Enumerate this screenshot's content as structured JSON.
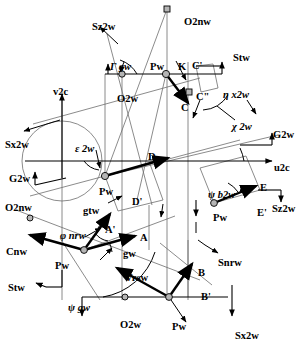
{
  "figure": {
    "type": "vector-diagram",
    "background_color": "#ffffff",
    "line_color": "#000000",
    "thin_line_color": "#555555",
    "node_fill": "#b0b0b0",
    "width": 302,
    "height": 347
  },
  "labels": [
    {
      "id": "sz2w-top",
      "text": "Sz2w",
      "x": 92,
      "y": 22,
      "italic": false
    },
    {
      "id": "o2nw-top",
      "text": "O2nw",
      "x": 184,
      "y": 17,
      "italic": false
    },
    {
      "id": "stw-top",
      "text": "Stw",
      "x": 233,
      "y": 53,
      "italic": false
    },
    {
      "id": "gamma-gw",
      "text": "Γ gw",
      "x": 110,
      "y": 62,
      "italic": true
    },
    {
      "id": "pw-top",
      "text": "Pw",
      "x": 150,
      "y": 62,
      "italic": false
    },
    {
      "id": "k-point",
      "text": "K",
      "x": 178,
      "y": 62,
      "italic": false
    },
    {
      "id": "cprime-top",
      "text": "C'",
      "x": 192,
      "y": 61,
      "italic": false
    },
    {
      "id": "v2c",
      "text": "v2c",
      "x": 53,
      "y": 87,
      "italic": false
    },
    {
      "id": "o2w-top",
      "text": "O2w",
      "x": 117,
      "y": 94,
      "italic": false
    },
    {
      "id": "c2prime",
      "text": "C\"",
      "x": 196,
      "y": 92,
      "italic": false
    },
    {
      "id": "c-point",
      "text": "C",
      "x": 181,
      "y": 103,
      "italic": false
    },
    {
      "id": "eta-x2w",
      "text": "η x2w",
      "x": 223,
      "y": 90,
      "italic": true
    },
    {
      "id": "chi-2w",
      "text": "χ 2w",
      "x": 232,
      "y": 122,
      "italic": true
    },
    {
      "id": "sx2w-left",
      "text": "Sx2w",
      "x": 5,
      "y": 140,
      "italic": false
    },
    {
      "id": "eps-2w",
      "text": "ε 2w",
      "x": 75,
      "y": 144,
      "italic": true
    },
    {
      "id": "g2w-right",
      "text": "G2w",
      "x": 273,
      "y": 130,
      "italic": false
    },
    {
      "id": "u2c",
      "text": "u2c",
      "x": 274,
      "y": 163,
      "italic": false
    },
    {
      "id": "d-point",
      "text": "D",
      "x": 148,
      "y": 152,
      "italic": false
    },
    {
      "id": "g2w-left",
      "text": "G2w",
      "x": 9,
      "y": 174,
      "italic": false
    },
    {
      "id": "pw-center",
      "text": "Pw",
      "x": 99,
      "y": 187,
      "italic": false
    },
    {
      "id": "dprime",
      "text": "D'",
      "x": 132,
      "y": 197,
      "italic": false
    },
    {
      "id": "psi-b2w",
      "text": "ψ b2w",
      "x": 208,
      "y": 190,
      "italic": true
    },
    {
      "id": "e-point",
      "text": "E",
      "x": 260,
      "y": 183,
      "italic": false
    },
    {
      "id": "o2nw-left",
      "text": "O2nw",
      "x": 5,
      "y": 203,
      "italic": false
    },
    {
      "id": "gtw",
      "text": "gtw",
      "x": 83,
      "y": 206,
      "italic": false
    },
    {
      "id": "eprime",
      "text": "E'",
      "x": 257,
      "y": 208,
      "italic": false
    },
    {
      "id": "sz2w-right",
      "text": "Sz2w",
      "x": 272,
      "y": 204,
      "italic": false
    },
    {
      "id": "pw-right",
      "text": "Pw",
      "x": 213,
      "y": 213,
      "italic": false
    },
    {
      "id": "phi-nrw",
      "text": "φ nrw",
      "x": 60,
      "y": 231,
      "italic": true
    },
    {
      "id": "aprime",
      "text": "A'",
      "x": 105,
      "y": 225,
      "italic": false
    },
    {
      "id": "a-point",
      "text": "A",
      "x": 140,
      "y": 233,
      "italic": false
    },
    {
      "id": "cnw",
      "text": "Cnw",
      "x": 6,
      "y": 247,
      "italic": false
    },
    {
      "id": "gw-label",
      "text": "gw",
      "x": 123,
      "y": 249,
      "italic": false
    },
    {
      "id": "snrw",
      "text": "Snrw",
      "x": 218,
      "y": 258,
      "italic": false
    },
    {
      "id": "pw-lower-l",
      "text": "Pw",
      "x": 55,
      "y": 261,
      "italic": false
    },
    {
      "id": "b-point",
      "text": "B",
      "x": 198,
      "y": 268,
      "italic": false
    },
    {
      "id": "vrsw",
      "text": "Vrsw",
      "x": 125,
      "y": 273,
      "italic": false
    },
    {
      "id": "stw-left",
      "text": "Stw",
      "x": 8,
      "y": 283,
      "italic": false
    },
    {
      "id": "bprime",
      "text": "B'",
      "x": 201,
      "y": 292,
      "italic": false
    },
    {
      "id": "psi-gw",
      "text": "ψ gw",
      "x": 68,
      "y": 303,
      "italic": true
    },
    {
      "id": "o2w-bottom",
      "text": "O2w",
      "x": 120,
      "y": 320,
      "italic": false
    },
    {
      "id": "pw-bottom",
      "text": "Pw",
      "x": 172,
      "y": 322,
      "italic": false
    },
    {
      "id": "sx2w-bottom",
      "text": "Sx2w",
      "x": 235,
      "y": 331,
      "italic": false
    }
  ],
  "nodes": [
    {
      "id": "node-o2nw-top",
      "x": 167,
      "y": 9,
      "shape": "square"
    },
    {
      "id": "node-o2w-top",
      "x": 122,
      "y": 74,
      "shape": "circle"
    },
    {
      "id": "node-pw-top",
      "x": 166,
      "y": 74,
      "shape": "circle"
    },
    {
      "id": "node-c2prime",
      "x": 189,
      "y": 92,
      "shape": "square"
    },
    {
      "id": "node-pw-center",
      "x": 105,
      "y": 176,
      "shape": "circle"
    },
    {
      "id": "node-pw-right",
      "x": 214,
      "y": 203,
      "shape": "circle"
    },
    {
      "id": "node-pw-lower",
      "x": 84,
      "y": 250,
      "shape": "circle"
    },
    {
      "id": "node-o2nw-left",
      "x": 30,
      "y": 218,
      "shape": "circle"
    },
    {
      "id": "node-o2w-bottom",
      "x": 125,
      "y": 297,
      "shape": "circle"
    },
    {
      "id": "node-pw-bottom",
      "x": 169,
      "y": 297,
      "shape": "circle"
    }
  ],
  "axes": {
    "horizontal_top": {
      "from_x": 105,
      "from_y": 74,
      "to_x": 222,
      "to_y": 74
    },
    "horizontal_mid": {
      "from_x": 25,
      "from_y": 161,
      "to_x": 278,
      "to_y": 161,
      "label": "u2c"
    },
    "vertical_left": {
      "from_x": 62,
      "from_y": 178,
      "to_x": 62,
      "to_y": 92,
      "label": "v2c"
    },
    "horizontal_bottom": {
      "from_x": 82,
      "from_y": 297,
      "to_x": 232,
      "to_y": 297
    }
  },
  "vectors": [
    {
      "id": "vector-C",
      "label": "C",
      "from": "Pw-top",
      "to": "C"
    },
    {
      "id": "vector-D",
      "label": "D",
      "from": "Pw-center",
      "to": "D"
    },
    {
      "id": "vector-E",
      "label": "E",
      "from": "Pw-right",
      "to": "E"
    },
    {
      "id": "vector-A",
      "label": "A",
      "from": "Pw-lower",
      "to": "A"
    },
    {
      "id": "vector-Aprime",
      "label": "A'",
      "from": "Pw-lower",
      "to": "A'"
    },
    {
      "id": "vector-Cnw",
      "label": "Cnw",
      "from": "Pw-lower",
      "to": "Cnw"
    },
    {
      "id": "vector-B",
      "label": "B",
      "from": "Pw-bottom",
      "to": "B"
    },
    {
      "id": "vector-Vrsw",
      "label": "Vrsw",
      "from": "Pw-bottom",
      "to": "Vrsw"
    }
  ],
  "angles": [
    {
      "id": "angle-gamma-gw",
      "symbol": "Γ",
      "name": "gw"
    },
    {
      "id": "angle-eta-x2w",
      "symbol": "η",
      "name": "x2w"
    },
    {
      "id": "angle-chi-2w",
      "symbol": "χ",
      "name": "2w"
    },
    {
      "id": "angle-eps-2w",
      "symbol": "ε",
      "name": "2w"
    },
    {
      "id": "angle-psi-b2w",
      "symbol": "ψ",
      "name": "b2w"
    },
    {
      "id": "angle-phi-nrw",
      "symbol": "φ",
      "name": "nrw"
    },
    {
      "id": "angle-psi-gw",
      "symbol": "ψ",
      "name": "gw"
    }
  ]
}
